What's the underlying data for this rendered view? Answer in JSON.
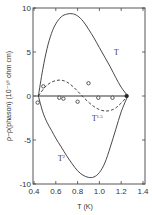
{
  "chart_data": {
    "type": "line",
    "title": "",
    "xlabel": "T (K)",
    "ylabel": "ρ−ρ(phason) (10⁻¹⁸ ohm cm)",
    "xlim": [
      0.4,
      1.4
    ],
    "ylim": [
      -10,
      10
    ],
    "xticks": [
      0.4,
      0.6,
      0.8,
      1.0,
      1.2,
      1.4
    ],
    "xtick_labels": [
      "0.4",
      "0.6",
      "0.8",
      "1.0",
      "1.2",
      "1.4"
    ],
    "yticks": [
      10,
      5,
      0,
      -5,
      -10
    ],
    "ytick_labels": [
      "10",
      "5",
      "0",
      "-5",
      "-10"
    ],
    "grid": false,
    "legend": null,
    "series": [
      {
        "name": "T",
        "style": "solid",
        "x": [
          0.44,
          0.48,
          0.52,
          0.56,
          0.6,
          0.65,
          0.7,
          0.75,
          0.8,
          0.85,
          0.9,
          0.95,
          1.0,
          1.05,
          1.1,
          1.15,
          1.2,
          1.26
        ],
        "y": [
          0,
          3.0,
          5.4,
          7.1,
          8.2,
          9.0,
          9.3,
          9.35,
          9.1,
          8.5,
          7.6,
          6.6,
          5.5,
          4.4,
          3.3,
          2.1,
          1.0,
          0
        ]
      },
      {
        "name": "T^1.5",
        "style": "dashed",
        "x": [
          0.44,
          0.5,
          0.55,
          0.6,
          0.65,
          0.7,
          0.75,
          0.8,
          0.85,
          0.9,
          0.95,
          1.0,
          1.05,
          1.1,
          1.15,
          1.2,
          1.26
        ],
        "y": [
          0,
          1.0,
          1.5,
          1.75,
          1.8,
          1.6,
          1.15,
          0.55,
          -0.1,
          -0.7,
          -1.2,
          -1.55,
          -1.7,
          -1.65,
          -1.35,
          -0.8,
          0
        ]
      },
      {
        "name": "T^2",
        "style": "solid",
        "x": [
          0.44,
          0.48,
          0.52,
          0.56,
          0.6,
          0.65,
          0.7,
          0.75,
          0.8,
          0.85,
          0.9,
          0.95,
          1.0,
          1.05,
          1.1,
          1.15,
          1.2,
          1.26
        ],
        "y": [
          0,
          -1.8,
          -3.0,
          -3.9,
          -4.8,
          -5.8,
          -6.8,
          -7.7,
          -8.5,
          -9.0,
          -9.25,
          -9.2,
          -8.7,
          -7.6,
          -5.8,
          -3.8,
          -1.8,
          0
        ]
      },
      {
        "name": "data",
        "style": "markers",
        "marker": "open-circle",
        "x": [
          0.434,
          0.485,
          0.632,
          0.67,
          0.8,
          0.9,
          0.99,
          1.12
        ],
        "y": [
          -0.75,
          1.1,
          -0.2,
          -0.3,
          -0.65,
          1.45,
          -0.2,
          -0.2
        ]
      },
      {
        "name": "data-filled",
        "style": "markers",
        "marker": "filled-circle",
        "x": [
          1.25
        ],
        "y": [
          0
        ]
      }
    ],
    "annotations": [
      {
        "text": "T",
        "x": 1.05,
        "y": 5.0
      },
      {
        "text": "T^1.5",
        "x": 1.0,
        "y": -2.6
      },
      {
        "text": "T^2",
        "x": 0.66,
        "y": -7.3
      }
    ]
  },
  "labels": {
    "xlabel": "T (K)",
    "ylabel": "ρ−ρ(phason) (10⁻¹⁸ ohm cm)",
    "curve_T": "T",
    "curve_T15_base": "T",
    "curve_T15_exp": "1.5",
    "curve_T2_base": "T",
    "curve_T2_exp": "2"
  }
}
